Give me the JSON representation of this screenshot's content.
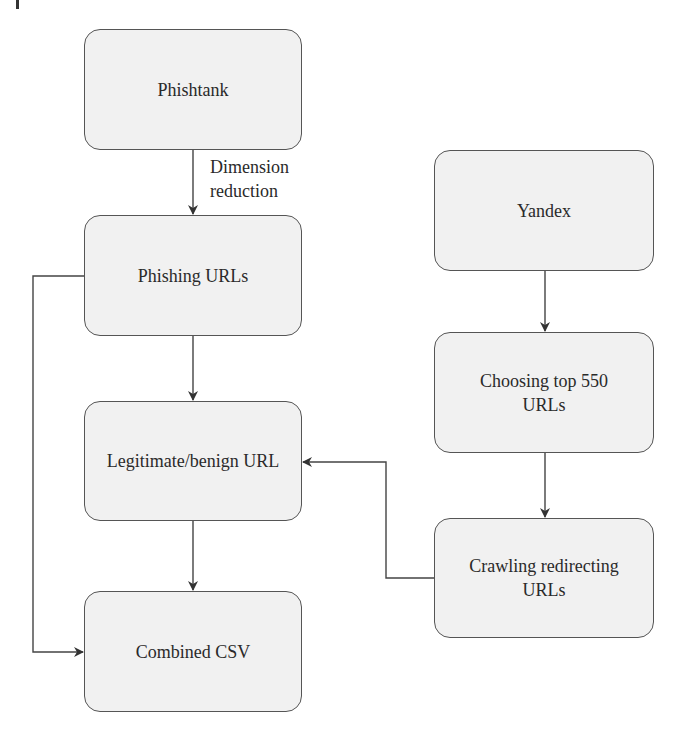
{
  "diagram": {
    "type": "flowchart",
    "nodes": [
      {
        "id": "phishtank",
        "label": "Phishtank"
      },
      {
        "id": "phishing_urls",
        "label": "Phishing URLs"
      },
      {
        "id": "legitimate",
        "label": "Legitimate/benign URL"
      },
      {
        "id": "combined",
        "label": "Combined CSV"
      },
      {
        "id": "yandex",
        "label": "Yandex"
      },
      {
        "id": "choosing",
        "label": "Choosing top 550 URLs"
      },
      {
        "id": "crawling",
        "label": "Crawling redirecting URLs"
      }
    ],
    "edges": [
      {
        "from": "phishtank",
        "to": "phishing_urls",
        "label": "Dimension reduction"
      },
      {
        "from": "phishing_urls",
        "to": "legitimate",
        "label": ""
      },
      {
        "from": "legitimate",
        "to": "combined",
        "label": ""
      },
      {
        "from": "phishing_urls",
        "to": "combined",
        "label": ""
      },
      {
        "from": "yandex",
        "to": "choosing",
        "label": ""
      },
      {
        "from": "choosing",
        "to": "crawling",
        "label": ""
      },
      {
        "from": "crawling",
        "to": "legitimate",
        "label": ""
      }
    ],
    "edge_label_line1": "Dimension",
    "edge_label_line2": "reduction"
  },
  "colors": {
    "node_fill": "#f1f1f1",
    "node_border": "#555555",
    "line": "#444444",
    "text": "#2a2a2a"
  }
}
